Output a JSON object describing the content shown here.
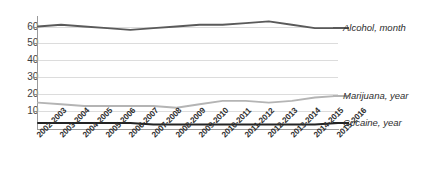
{
  "chart_data": {
    "type": "line",
    "title": "",
    "subtitle": "",
    "xlabel": "",
    "ylabel": "",
    "ylim": [
      0,
      65
    ],
    "yticks": [
      10,
      20,
      30,
      40,
      50,
      60
    ],
    "grid": true,
    "legend_position": "right",
    "categories": [
      "2002-2003",
      "2003-2004",
      "2004-2005",
      "2005-2006",
      "2006-2007",
      "2007-2008",
      "2008-2009",
      "2009-2010",
      "2010-2011",
      "2011-2012",
      "2012-2013",
      "2013-2014",
      "2014-2015",
      "2015-2016"
    ],
    "series": [
      {
        "name": "Alcohol, month",
        "color": "#5a5a5a",
        "values": [
          60,
          61,
          60,
          59,
          58,
          59,
          60,
          61,
          61,
          62,
          63,
          61,
          59,
          59
        ]
      },
      {
        "name": "Marijuana, year",
        "color": "#b4b4b4",
        "values": [
          15,
          14,
          13,
          13,
          13,
          13,
          12,
          14,
          16,
          16,
          15,
          16,
          18,
          19
        ]
      },
      {
        "name": "Cocaine, year",
        "color": "#232323",
        "values": [
          3,
          3,
          3,
          3,
          3,
          2,
          2,
          2,
          2,
          2,
          2,
          2,
          2,
          3
        ]
      }
    ]
  },
  "legend": {
    "items": [
      {
        "label": "Alcohol, month",
        "color": "#5a5a5a"
      },
      {
        "label": "Marijuana, year",
        "color": "#b4b4b4"
      },
      {
        "label": "Cocaine, year",
        "color": "#232323"
      }
    ]
  },
  "axes": {
    "y_tick_labels": [
      "60",
      "50",
      "40",
      "30",
      "20",
      "10"
    ],
    "x_tick_labels": [
      "2002-2003",
      "2003-2004",
      "2004-2005",
      "2005-2006",
      "2006-2007",
      "2007-2008",
      "2008-2009",
      "2009-2010",
      "2010-2011",
      "2011-2012",
      "2012-2013",
      "2013-2014",
      "2014-2015",
      "2015-2016"
    ]
  }
}
